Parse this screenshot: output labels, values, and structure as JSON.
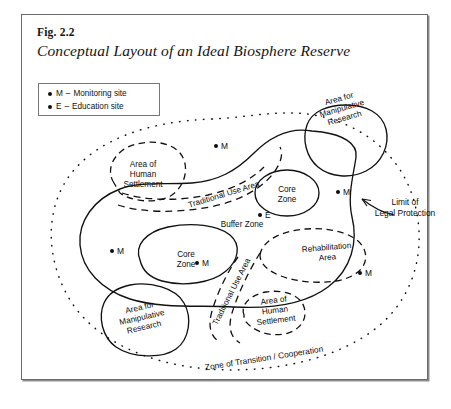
{
  "figure": {
    "number": "Fig. 2.2",
    "title": "Conceptual Layout of an Ideal Biosphere Reserve"
  },
  "legend": {
    "items": [
      {
        "symbol": "M",
        "dash": "–",
        "label": "Monitoring site"
      },
      {
        "symbol": "E",
        "dash": "–",
        "label": "Education site"
      }
    ]
  },
  "diagram": {
    "zones": [
      {
        "name": "manipulative-research-upper",
        "label": "Area for\nManipulative\nResearch",
        "boundary": "solid"
      },
      {
        "name": "human-settlement-upper",
        "label": "Area of\nHuman\nSettlement",
        "boundary": "dashed"
      },
      {
        "name": "core-zone-upper",
        "label": "Core\nZone",
        "boundary": "solid"
      },
      {
        "name": "core-zone-lower",
        "label": "Core\nZone",
        "boundary": "solid"
      },
      {
        "name": "rehabilitation-area",
        "label": "Rehabilitation\nArea",
        "boundary": "dashed"
      },
      {
        "name": "manipulative-research-lower",
        "label": "Area for\nManipulative\nResearch",
        "boundary": "solid"
      },
      {
        "name": "human-settlement-lower",
        "label": "Area of\nHuman\nSettlement",
        "boundary": "dashed"
      }
    ],
    "area_labels": {
      "traditional_use_upper": "Traditional Use Area",
      "traditional_use_lower": "Traditional Use Area",
      "buffer_zone": "Buffer Zone",
      "transition_zone": "Zone of Transition / Cooperation"
    },
    "annotations": [
      {
        "name": "limit-of-legal-protection",
        "label": "Limit of\nLegal Protection"
      }
    ],
    "markers": [
      {
        "name": "marker-m-top",
        "symbol": "M",
        "x": 192,
        "y": 126
      },
      {
        "name": "marker-m-upper-right",
        "symbol": "M",
        "x": 314,
        "y": 172
      },
      {
        "name": "marker-e-center",
        "symbol": "E",
        "x": 236,
        "y": 195
      },
      {
        "name": "marker-m-left",
        "symbol": "M",
        "x": 88,
        "y": 231
      },
      {
        "name": "marker-m-core-lower",
        "symbol": "M",
        "x": 173,
        "y": 243
      },
      {
        "name": "marker-m-rehabilitation",
        "symbol": "M",
        "x": 336,
        "y": 253
      }
    ]
  }
}
